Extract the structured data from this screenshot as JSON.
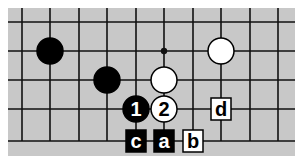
{
  "diagram": {
    "type": "go-board-fragment",
    "grid": {
      "cols": [
        22,
        50,
        79,
        107,
        136,
        164,
        193,
        221,
        250,
        278
      ],
      "rows": [
        22,
        51,
        80,
        109,
        141
      ]
    },
    "stones": [
      {
        "color": "black",
        "col": 1,
        "row": 1,
        "label": ""
      },
      {
        "color": "black",
        "col": 3,
        "row": 2,
        "label": ""
      },
      {
        "color": "white",
        "col": 7,
        "row": 1,
        "label": ""
      },
      {
        "color": "white",
        "col": 5,
        "row": 2,
        "label": ""
      },
      {
        "color": "black",
        "col": 4,
        "row": 3,
        "label": "1"
      },
      {
        "color": "white",
        "col": 5,
        "row": 3,
        "label": "2"
      }
    ],
    "star_points": [
      {
        "col": 5,
        "row": 1
      }
    ],
    "markers": [
      {
        "label": "c",
        "col": 4,
        "row": 4,
        "style": "dark"
      },
      {
        "label": "a",
        "col": 5,
        "row": 4,
        "style": "dark"
      },
      {
        "label": "b",
        "col": 6,
        "row": 4,
        "style": "light"
      },
      {
        "label": "d",
        "col": 7,
        "row": 3,
        "style": "light"
      }
    ]
  }
}
